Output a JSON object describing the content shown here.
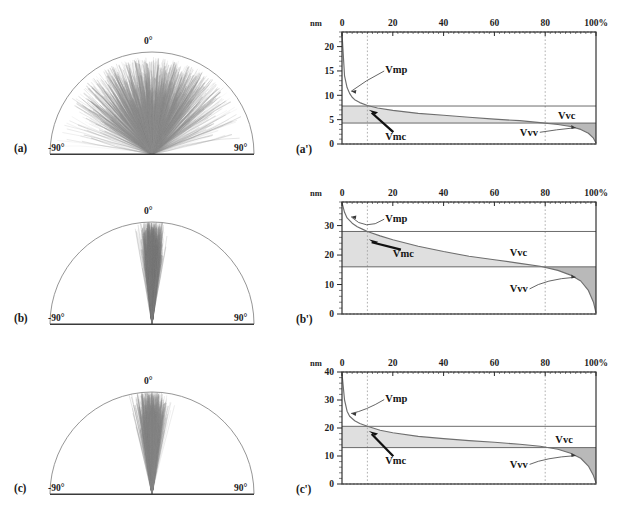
{
  "figure": {
    "caption_letters": [
      "(a)",
      "(b)",
      "(c)",
      "(a')",
      "(b')",
      "(c')"
    ],
    "background": "#ffffff",
    "ink": "#1a1a1a"
  },
  "polar": {
    "angle_labels": {
      "left": "-90°",
      "center": "0°",
      "right": "90°"
    },
    "panels": [
      {
        "letter": "(a)",
        "spread_deg": 62,
        "fill": "#8e8e8e",
        "description": "broad fan"
      },
      {
        "letter": "(b)",
        "spread_deg": 7,
        "fill": "#7d7d7d",
        "description": "narrow column"
      },
      {
        "letter": "(c)",
        "spread_deg": 9,
        "fill": "#888888",
        "description": "narrow column"
      }
    ]
  },
  "abbott": {
    "x_unit_label": "nm",
    "x_tick_labels": [
      "0",
      "20",
      "40",
      "60",
      "80",
      "100%"
    ],
    "x_ticks": [
      0,
      20,
      40,
      60,
      80,
      100
    ],
    "x_percent_suffix": "%",
    "guide_percent": [
      10,
      80
    ],
    "annotations": [
      "Vmp",
      "Vmc",
      "Vvc",
      "Vvv"
    ],
    "colors": {
      "axis": "#2a2a2a",
      "curve": "#6f6f6f",
      "fill_light": "#d9d9d9",
      "fill_dark": "#a7a7a7",
      "guide": "#9a9a9a"
    }
  },
  "chart_data": [
    {
      "type": "line",
      "panel": "(a')",
      "title": "",
      "xlabel": "%",
      "ylabel": "nm",
      "xlim": [
        0,
        100
      ],
      "ylim": [
        0,
        23
      ],
      "x_ticks": [
        0,
        20,
        40,
        60,
        80,
        100
      ],
      "y_ticks": [
        0,
        5,
        10,
        15,
        20
      ],
      "grid": "dotted-vertical",
      "guide_lines_x": [
        10,
        80
      ],
      "level_lines_y": [
        7.8,
        4.3
      ],
      "series": [
        {
          "name": "bearing-area (Abbott-Firestone) curve",
          "x": [
            0,
            1,
            2,
            3,
            4,
            5,
            7,
            10,
            14,
            20,
            30,
            40,
            50,
            60,
            70,
            78,
            85,
            90,
            94,
            97,
            99,
            100
          ],
          "y": [
            22.8,
            14.0,
            11.6,
            10.4,
            9.6,
            9.1,
            8.5,
            7.9,
            7.4,
            6.9,
            6.3,
            5.9,
            5.5,
            5.1,
            4.8,
            4.4,
            4.0,
            3.6,
            3.0,
            2.2,
            1.2,
            0.2
          ]
        }
      ],
      "annotations": [
        {
          "label": "Vmp",
          "x": 17,
          "y": 15.2
        },
        {
          "label": "Vmc",
          "x": 17,
          "y": 1.6
        },
        {
          "label": "Vvc",
          "x": 85,
          "y": 5.8
        },
        {
          "label": "Vvv",
          "x": 70,
          "y": 2.4
        }
      ]
    },
    {
      "type": "line",
      "panel": "(b')",
      "title": "",
      "xlabel": "%",
      "ylabel": "nm",
      "xlim": [
        0,
        100
      ],
      "ylim": [
        0,
        38
      ],
      "x_ticks": [
        0,
        20,
        40,
        60,
        80,
        100
      ],
      "y_ticks": [
        0,
        10,
        20,
        30
      ],
      "grid": "dotted-vertical",
      "guide_lines_x": [
        10,
        80
      ],
      "level_lines_y": [
        28.0,
        16.0
      ],
      "series": [
        {
          "name": "bearing-area (Abbott-Firestone) curve",
          "x": [
            0,
            1,
            2,
            4,
            6,
            8,
            10,
            15,
            20,
            30,
            40,
            50,
            60,
            70,
            78,
            85,
            90,
            94,
            97,
            99,
            100
          ],
          "y": [
            37.8,
            34.5,
            32.6,
            30.8,
            29.6,
            28.8,
            28.0,
            26.5,
            25.2,
            23.0,
            21.2,
            19.6,
            18.4,
            17.2,
            16.2,
            14.8,
            13.2,
            11.2,
            8.0,
            4.0,
            0.4
          ]
        }
      ],
      "annotations": [
        {
          "label": "Vmp",
          "x": 17,
          "y": 32.5
        },
        {
          "label": "Vmc",
          "x": 20,
          "y": 20.5
        },
        {
          "label": "Vvc",
          "x": 66,
          "y": 21.0
        },
        {
          "label": "Vvv",
          "x": 66,
          "y": 8.5
        }
      ]
    },
    {
      "type": "line",
      "panel": "(c')",
      "title": "",
      "xlabel": "%",
      "ylabel": "nm",
      "xlim": [
        0,
        100
      ],
      "ylim": [
        0,
        40
      ],
      "x_ticks": [
        0,
        20,
        40,
        60,
        80,
        100
      ],
      "y_ticks": [
        0,
        10,
        20,
        30,
        40
      ],
      "grid": "dotted-vertical",
      "guide_lines_x": [
        10,
        80
      ],
      "level_lines_y": [
        20.6,
        13.0
      ],
      "series": [
        {
          "name": "bearing-area (Abbott-Firestone) curve",
          "x": [
            0,
            1,
            2,
            3,
            5,
            7,
            10,
            15,
            20,
            30,
            40,
            50,
            60,
            70,
            78,
            85,
            90,
            94,
            97,
            99,
            100
          ],
          "y": [
            39.5,
            30.0,
            26.0,
            24.2,
            22.6,
            21.6,
            20.6,
            19.2,
            18.3,
            17.0,
            16.2,
            15.5,
            14.9,
            14.2,
            13.5,
            12.4,
            11.0,
            9.2,
            6.4,
            3.0,
            0.4
          ]
        }
      ],
      "annotations": [
        {
          "label": "Vmp",
          "x": 17,
          "y": 30.5
        },
        {
          "label": "Vmc",
          "x": 17,
          "y": 8.5
        },
        {
          "label": "Vvc",
          "x": 84,
          "y": 16.0
        },
        {
          "label": "Vvv",
          "x": 66,
          "y": 7.0
        }
      ]
    }
  ]
}
